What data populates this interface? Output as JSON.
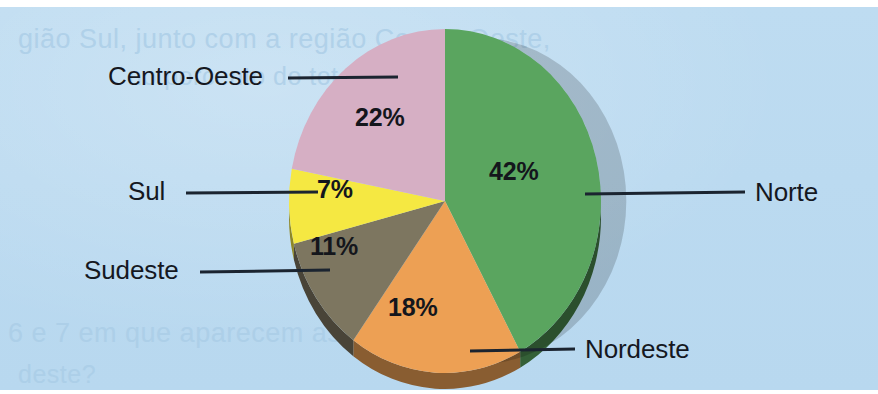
{
  "chart_data": {
    "type": "pie",
    "title": "",
    "categories": [
      "Norte",
      "Nordeste",
      "Sudeste",
      "Sul",
      "Centro-Oeste"
    ],
    "values": [
      42,
      18,
      11,
      7,
      22
    ],
    "value_labels": [
      "42%",
      "18%",
      "11%",
      "7%",
      "22%"
    ],
    "unit": "%",
    "total": 100,
    "legend": "none",
    "grid": false,
    "start_angle_deg": 0,
    "direction": "clockwise",
    "three_d": true,
    "colors": [
      "#5aa55f",
      "#eda054",
      "#7d7660",
      "#f5e842",
      "#d6afc4"
    ],
    "slices": [
      {
        "label": "Norte",
        "value": 42,
        "value_label": "42%",
        "color": "#5aa55f"
      },
      {
        "label": "Nordeste",
        "value": 18,
        "value_label": "18%",
        "color": "#eda054"
      },
      {
        "label": "Sudeste",
        "value": 11,
        "value_label": "11%",
        "color": "#7d7660"
      },
      {
        "label": "Sul",
        "value": 7,
        "value_label": "7%",
        "color": "#f5e842"
      },
      {
        "label": "Centro-Oeste",
        "value": 22,
        "value_label": "22%",
        "color": "#d6afc4"
      }
    ]
  },
  "labels": {
    "norte": "Norte",
    "nordeste": "Nordeste",
    "sudeste": "Sudeste",
    "sul": "Sul",
    "centro_oeste": "Centro-Oeste"
  },
  "percent_labels": {
    "norte": "42%",
    "nordeste": "18%",
    "sudeste": "11%",
    "sul": "7%",
    "centro_oeste": "22%"
  },
  "background": {
    "paper_color": "#bcdaf0",
    "ghost_text_1": "gião Sul, junto com a região Centro-Oeste,",
    "ghost_text_2": "no porcento do total de...",
    "ghost_text_3": "6 e 7 em que aparecem as regiões Norte",
    "ghost_text_4": "deste?"
  }
}
